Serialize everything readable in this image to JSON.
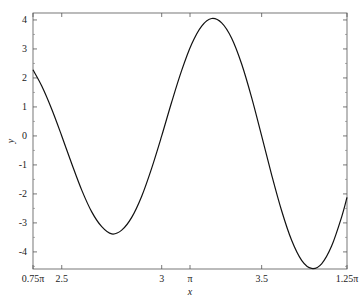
{
  "chart_data": {
    "type": "line",
    "title": "",
    "xlabel": "x",
    "ylabel": "y",
    "xlim": [
      2.35619,
      3.92699
    ],
    "ylim": [
      -4.59,
      4.24
    ],
    "grid": false,
    "legend": null,
    "x_ticks": [
      {
        "value": 2.35619,
        "label": "0.75π"
      },
      {
        "value": 2.5,
        "label": "2.5"
      },
      {
        "value": 3.0,
        "label": "3"
      },
      {
        "value": 3.14159,
        "label": "π"
      },
      {
        "value": 3.5,
        "label": "3.5"
      },
      {
        "value": 3.92699,
        "label": "1.25π"
      }
    ],
    "y_ticks": [
      {
        "value": 4,
        "label": "4"
      },
      {
        "value": 3,
        "label": "3"
      },
      {
        "value": 2,
        "label": "2"
      },
      {
        "value": 1,
        "label": "1"
      },
      {
        "value": 0,
        "label": "0"
      },
      {
        "value": -1,
        "label": "-1"
      },
      {
        "value": -2,
        "label": "-2"
      },
      {
        "value": -3,
        "label": "-3"
      },
      {
        "value": -4,
        "label": "-4"
      }
    ],
    "series": [
      {
        "name": "y",
        "color": "#111111",
        "x": [
          2.356,
          2.4,
          2.45,
          2.5,
          2.55,
          2.6,
          2.65,
          2.7,
          2.75,
          2.8,
          2.85,
          2.9,
          2.95,
          3.0,
          3.05,
          3.1,
          3.15,
          3.2,
          3.25,
          3.3,
          3.35,
          3.4,
          3.45,
          3.5,
          3.55,
          3.6,
          3.65,
          3.7,
          3.75,
          3.8,
          3.85,
          3.9,
          3.927
        ],
        "y": [
          2.28,
          1.72,
          0.92,
          0.0,
          -0.96,
          -1.87,
          -2.62,
          -3.13,
          -3.38,
          -3.25,
          -2.81,
          -2.08,
          -1.11,
          0.0,
          1.17,
          2.26,
          3.17,
          3.79,
          4.05,
          3.9,
          3.37,
          2.48,
          1.32,
          0.0,
          -1.34,
          -2.58,
          -3.6,
          -4.29,
          -4.57,
          -4.41,
          -3.8,
          -2.8,
          -2.12
        ]
      }
    ]
  }
}
